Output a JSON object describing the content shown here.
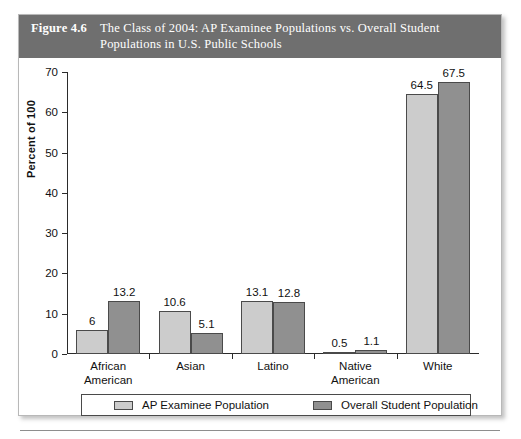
{
  "figure": {
    "number": "Figure 4.6",
    "title_line1": "The Class of 2004: AP Examinee Populations vs. Overall Student",
    "title_line2": "Populations in U.S. Public Schools"
  },
  "colors": {
    "header_band": "#6f6f6f",
    "series_light": "#cccccc",
    "series_dark": "#909090",
    "axis": "#2b2b2b",
    "text": "#111111"
  },
  "chart_data": {
    "type": "bar",
    "title": "The Class of 2004: AP Examinee Populations vs. Overall Student Populations in U.S. Public Schools",
    "xlabel": "",
    "ylabel": "Percent of 100",
    "ylim": [
      0,
      70
    ],
    "yticks": [
      0,
      10,
      20,
      30,
      40,
      50,
      60,
      70
    ],
    "ytick_labels": [
      "0",
      "10",
      "20",
      "30",
      "40",
      "50",
      "60",
      "70"
    ],
    "grid": false,
    "legend_position": "bottom",
    "categories": [
      "African American",
      "Asian",
      "Latino",
      "Native American",
      "White"
    ],
    "category_lines": [
      [
        "African",
        "American"
      ],
      [
        "Asian"
      ],
      [
        "Latino"
      ],
      [
        "Native",
        "American"
      ],
      [
        "White"
      ]
    ],
    "series": [
      {
        "name": "AP Examinee Population",
        "color": "#cccccc",
        "values": [
          6,
          10.6,
          13.1,
          0.5,
          64.5
        ],
        "labels": [
          "6",
          "10.6",
          "13.1",
          "0.5",
          "64.5"
        ]
      },
      {
        "name": "Overall Student Population",
        "color": "#909090",
        "values": [
          13.2,
          5.1,
          12.8,
          1.1,
          67.5
        ],
        "labels": [
          "13.2",
          "5.1",
          "12.8",
          "1.1",
          "67.5"
        ]
      }
    ]
  }
}
